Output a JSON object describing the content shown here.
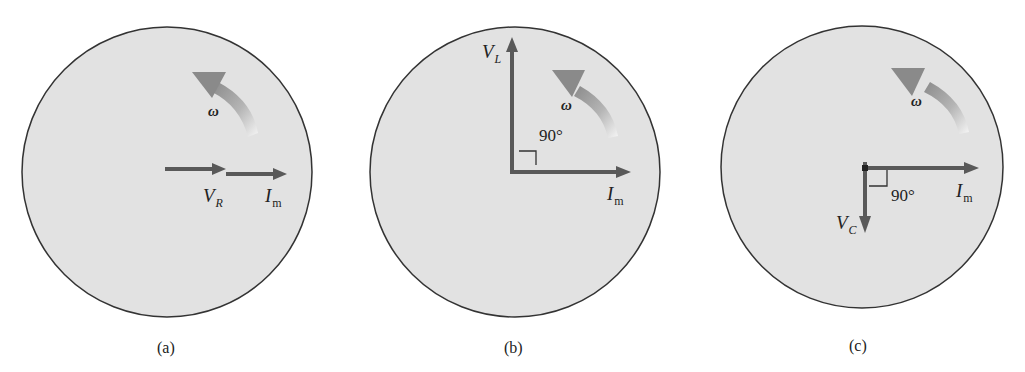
{
  "figure": {
    "panels": [
      {
        "id": "a",
        "caption": "(a)",
        "element": "resistor",
        "omega_label": "ω",
        "phasors": [
          {
            "name": "V",
            "subscript": "R",
            "direction": "right",
            "note": "in phase with current"
          },
          {
            "name": "I",
            "subscript": "m",
            "direction": "right"
          }
        ],
        "angle_label": ""
      },
      {
        "id": "b",
        "caption": "(b)",
        "element": "inductor",
        "omega_label": "ω",
        "phasors": [
          {
            "name": "V",
            "subscript": "L",
            "direction": "up",
            "note": "leads current by 90°"
          },
          {
            "name": "I",
            "subscript": "m",
            "direction": "right"
          }
        ],
        "angle_label": "90°"
      },
      {
        "id": "c",
        "caption": "(c)",
        "element": "capacitor",
        "omega_label": "ω",
        "phasors": [
          {
            "name": "V",
            "subscript": "C",
            "direction": "down",
            "note": "lags current by 90°"
          },
          {
            "name": "I",
            "subscript": "m",
            "direction": "right"
          }
        ],
        "angle_label": "90°"
      }
    ],
    "colors": {
      "disk_fill": "#e2e2e2",
      "disk_stroke": "#333333",
      "arrow": "#595959",
      "rotation_arrow_dark": "#8a8a8a",
      "rotation_arrow_light": "#f4f4f4",
      "text": "#222222"
    }
  }
}
